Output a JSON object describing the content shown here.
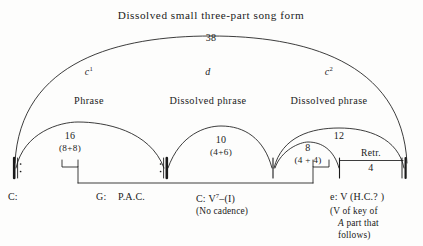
{
  "diagram": {
    "title": "Dissolved small three-part song form",
    "total_measures": "38",
    "sections": [
      {
        "label": "c",
        "sup": "1",
        "phrase_type": "Phrase"
      },
      {
        "label": "d",
        "sup": "",
        "phrase_type": "Dissolved phrase"
      },
      {
        "label": "c",
        "sup": "2",
        "phrase_type": "Dissolved phrase"
      }
    ],
    "spans": [
      {
        "count": "16",
        "breakdown": "(8+8)"
      },
      {
        "count": "10",
        "breakdown": "(4+6)"
      },
      {
        "count": "12",
        "breakdown": ""
      },
      {
        "count": "8",
        "breakdown": "(4 + 4)"
      },
      {
        "count": "4",
        "breakdown": ""
      }
    ],
    "retransition_label": "Retr.",
    "harmonic_labels": {
      "opening_key": "C:",
      "first_cadence_key": "G:",
      "first_cadence_type": "P.A.C.",
      "second_key": "C:",
      "second_chord": "V",
      "second_chord_sup": "7",
      "second_chord_resolution": "–(I)",
      "second_cadence_note": "(No cadence)",
      "final_key": "e: V (H.C.? )",
      "final_note_line1": "(V of key of",
      "final_note_line2_italic": "A",
      "final_note_line2_rest": "part that",
      "final_note_line3": "follows)"
    },
    "barlines": [
      {
        "name": "opening-repeat",
        "type": "left-repeat"
      },
      {
        "name": "closing-repeat",
        "type": "right-repeat"
      },
      {
        "name": "plain-barline-c2-start",
        "type": "plain"
      },
      {
        "name": "plain-barline-retransition",
        "type": "plain"
      },
      {
        "name": "final-double-barline",
        "type": "double"
      }
    ],
    "colors": {
      "ink": "#1a1a1a",
      "background": "#fdfdfc"
    }
  }
}
